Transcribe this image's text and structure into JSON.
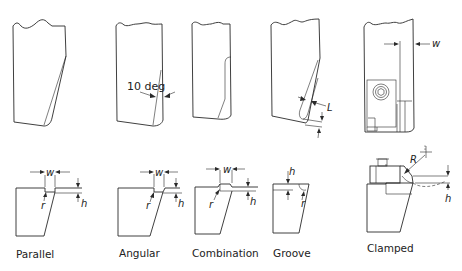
{
  "diagram": {
    "top_row_annotations": {
      "angle_label": "10 deg",
      "groove_dimension": "L",
      "clamped_dimension": "w"
    },
    "bottom_row": [
      {
        "caption": "Parallel",
        "dims": {
          "width": "w",
          "height": "h",
          "radius": "r"
        }
      },
      {
        "caption": "Angular",
        "dims": {
          "width": "w",
          "height": "h",
          "radius": "r"
        }
      },
      {
        "caption": "Combination",
        "dims": {
          "width": "w",
          "height": "h",
          "radius": "r"
        }
      },
      {
        "caption": "Groove",
        "dims": {
          "height": "h",
          "radius": "r"
        }
      },
      {
        "caption": "Clamped",
        "dims": {
          "radius": "R",
          "height": "h"
        }
      }
    ]
  }
}
